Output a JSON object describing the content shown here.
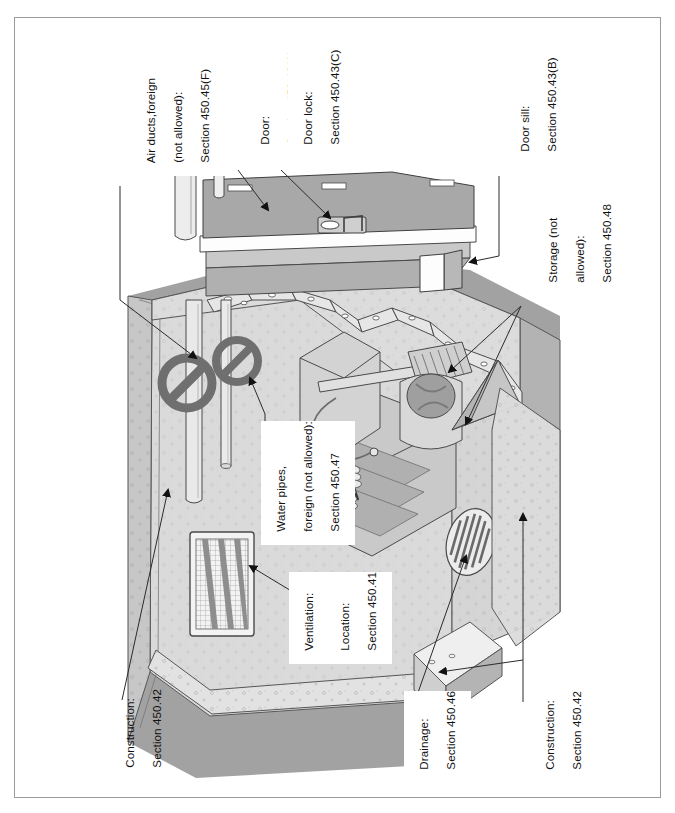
{
  "document": {
    "title": "Transformer Vault Requirements Diagram",
    "border_color": "#9b9b9b",
    "background": "#ffffff"
  },
  "diagram": {
    "type": "isometric-cutaway-illustration",
    "text_orientation": "rotated-90-ccw",
    "palette": {
      "ink": "#111111",
      "outline": "#4a4a4a",
      "door_top": "#a8a8a8",
      "wall_light": "#e3e3e3",
      "wall_mid": "#cfcfcf",
      "wall_dark": "#a9a9a9",
      "floor": "#d9d9d9",
      "ground_dark": "#9a9a9a",
      "pipe": "#e8e8e8",
      "prohibit": "#6f6f6f",
      "transformer": "#bdbdbd",
      "white": "#ffffff"
    },
    "callouts": [
      {
        "id": "air-ducts",
        "lines": [
          "Air ducts,foreign",
          "(not allowed):",
          "Section 450.45(F)"
        ],
        "label_x": 131,
        "label_y": 176,
        "leader": "M118,182 L118,300 L196,360",
        "arrow": [
          196,
          360,
          28
        ],
        "prohibited": true
      },
      {
        "id": "door",
        "lines": [
          "Door:",
          "Section 450.43(A)"
        ],
        "label_x": 245,
        "label_y": 158,
        "leader": "M238,166 L268,212",
        "arrow": [
          268,
          212,
          55
        ],
        "prohibited": false
      },
      {
        "id": "door-lock",
        "lines": [
          "Door lock:",
          "Section 450.43(C)"
        ],
        "label_x": 288,
        "label_y": 158,
        "leader": "M281,166 L331,221",
        "arrow": [
          331,
          221,
          48
        ],
        "prohibited": false
      },
      {
        "id": "door-sill",
        "lines": [
          "Door sill:",
          "Section 450.43(B)"
        ],
        "label_x": 505,
        "label_y": 165,
        "leader": "M498,172 L498,255 L467,261",
        "arrow": [
          467,
          261,
          170
        ],
        "prohibited": false
      },
      {
        "id": "storage",
        "lines": [
          "Storage (not",
          "allowed):",
          "Section 450.48"
        ],
        "label_x": 533,
        "label_y": 296,
        "leader": "M521,302 L447,372 M521,302 L463,424",
        "arrow": [
          447,
          372,
          225
        ],
        "arrow2": [
          463,
          424,
          250
        ],
        "prohibited": true
      },
      {
        "id": "water-pipes",
        "lines": [
          "Water pipes,",
          "foreign (not allowed):",
          "Section 450.47"
        ],
        "label_x": 261,
        "label_y": 545,
        "leader": "M266,432 L266,412 M249,420 L249,375",
        "arrow": [
          249,
          375,
          20
        ],
        "prohibited": true
      },
      {
        "id": "ventilation",
        "lines": [
          "Ventilation:",
          "Section 450.45"
        ],
        "label_x": 289,
        "label_y": 664,
        "leader": "M288,592 L246,564",
        "arrow": [
          246,
          564,
          215
        ],
        "prohibited": false
      },
      {
        "id": "location",
        "lines": [
          "Location:",
          "Section 450.41"
        ],
        "label_x": 325,
        "label_y": 664,
        "leader": "",
        "prohibited": false
      },
      {
        "id": "construction-left",
        "lines": [
          "Construction:",
          "Section 450.42"
        ],
        "label_x": 110,
        "label_y": 781,
        "leader": "M119,700 L168,486",
        "arrow": [
          168,
          486,
          348
        ],
        "prohibited": false
      },
      {
        "id": "drainage",
        "lines": [
          "Drainage:",
          "Section 450.46"
        ],
        "label_x": 404,
        "label_y": 783,
        "leader": "M412,706 L466,552",
        "arrow": [
          466,
          552,
          340
        ],
        "prohibited": false
      },
      {
        "id": "construction-right",
        "lines": [
          "Construction:",
          "Section 450.42"
        ],
        "label_x": 530,
        "label_y": 783,
        "leader": "M521,706 L521,510 M521,660 L436,672",
        "arrow": [
          521,
          510,
          350
        ],
        "arrow2": [
          436,
          672,
          100
        ],
        "prohibited": false
      }
    ],
    "features": [
      {
        "name": "vault-door-hatch",
        "section": "450.43(A)"
      },
      {
        "name": "door-lock-hasp",
        "section": "450.43(C)"
      },
      {
        "name": "door-sill-curb",
        "section": "450.43(B)"
      },
      {
        "name": "foreign-air-duct-large",
        "section": "450.45(F)",
        "allowed": false
      },
      {
        "name": "foreign-air-duct-small",
        "section": "450.45(F)",
        "allowed": false
      },
      {
        "name": "foreign-water-pipe",
        "section": "450.47",
        "allowed": false
      },
      {
        "name": "ventilation-louver",
        "section": "450.45"
      },
      {
        "name": "floor-drain-grate",
        "section": "450.46"
      },
      {
        "name": "transformer-unit",
        "section": "450.41"
      },
      {
        "name": "reinforced-concrete-walls",
        "section": "450.42"
      },
      {
        "name": "stored-material-boxes",
        "section": "450.48",
        "allowed": false
      }
    ]
  }
}
